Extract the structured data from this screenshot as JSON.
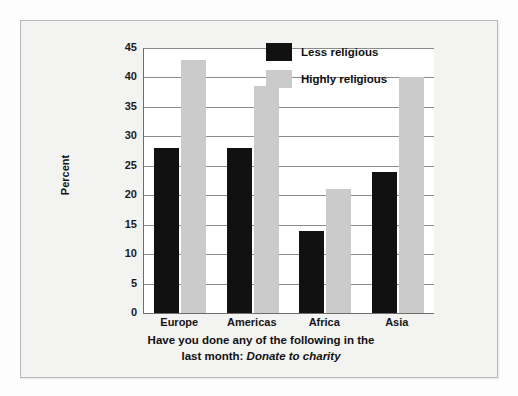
{
  "chart_data": {
    "type": "bar",
    "title": "",
    "caption_line1": "Have you done any of the following in the",
    "caption_line2_prefix": "last month: ",
    "caption_line2_italic": "Donate to charity",
    "categories": [
      "Europe",
      "Americas",
      "Africa",
      "Asia"
    ],
    "series": [
      {
        "name": "Less religious",
        "color": "#111111",
        "values": [
          28,
          28,
          14,
          24
        ]
      },
      {
        "name": "Highly religious",
        "color": "#cbcbcb",
        "values": [
          43,
          38.5,
          21,
          40
        ]
      }
    ],
    "xlabel": "",
    "ylabel": "Percent",
    "ylim": [
      0,
      45
    ],
    "ytick_step": 5,
    "yticks": [
      "45",
      "40",
      "35",
      "30",
      "25",
      "20",
      "15",
      "10",
      "5",
      "0"
    ],
    "grid": true,
    "legend_position": "top-right"
  },
  "axis": {
    "y_title": "Percent"
  },
  "legend": {
    "items": [
      {
        "label": "Less religious",
        "swatch": "black-swatch"
      },
      {
        "label": "Highly religious",
        "swatch": "gray-swatch"
      }
    ]
  }
}
